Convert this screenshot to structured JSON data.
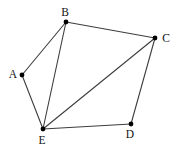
{
  "graph": {
    "type": "undirected-graph",
    "background": "#ffffff",
    "edge_color": "#3d3d3d",
    "edge_width": 1.1,
    "vertex_color": "#000000",
    "vertex_radius": 2.4,
    "label_color": "#111111",
    "vertices": [
      {
        "id": "A",
        "label": "A",
        "x": 22,
        "y": 75,
        "label_x": 13,
        "label_y": 78
      },
      {
        "id": "B",
        "label": "B",
        "x": 66,
        "y": 22,
        "label_x": 65,
        "label_y": 16
      },
      {
        "id": "C",
        "label": "C",
        "x": 155,
        "y": 38,
        "label_x": 166,
        "label_y": 42
      },
      {
        "id": "D",
        "label": "D",
        "x": 131,
        "y": 124,
        "label_x": 130,
        "label_y": 138
      },
      {
        "id": "E",
        "label": "E",
        "x": 43,
        "y": 129,
        "label_x": 42,
        "label_y": 144
      }
    ],
    "edges": [
      {
        "from": "A",
        "to": "B"
      },
      {
        "from": "B",
        "to": "C"
      },
      {
        "from": "C",
        "to": "D"
      },
      {
        "from": "D",
        "to": "E"
      },
      {
        "from": "E",
        "to": "A"
      },
      {
        "from": "B",
        "to": "E"
      },
      {
        "from": "C",
        "to": "E"
      }
    ]
  }
}
